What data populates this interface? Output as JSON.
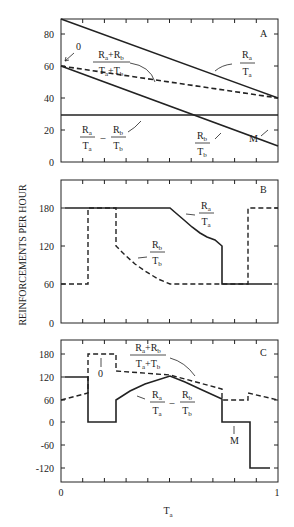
{
  "figure": {
    "ylabel": "REINFORCEMENTS PER HOUR",
    "xlabel": "T",
    "xlabel_sub": "a",
    "x_ticks": [
      "0",
      "1"
    ]
  },
  "chart_data": [
    {
      "panel": "A",
      "type": "line",
      "xlabel": "T_a",
      "ylabel": "REINFORCEMENTS PER HOUR",
      "xlim": [
        0,
        1
      ],
      "ylim": [
        0,
        90
      ],
      "y_ticks": [
        0,
        20,
        40,
        60,
        80
      ],
      "series": [
        {
          "name": "R_a/T_a",
          "style": "solid",
          "x": [
            0,
            1
          ],
          "y": [
            90,
            40
          ]
        },
        {
          "name": "(R_a+R_b)/(T_a+T_b)",
          "style": "dashed",
          "x": [
            0,
            1
          ],
          "y": [
            60,
            40
          ]
        },
        {
          "name": "R_b/T_b",
          "style": "solid",
          "x": [
            0,
            1
          ],
          "y": [
            60,
            10
          ]
        },
        {
          "name": "R_a/T_a - R_b/T_b (M)",
          "style": "solid",
          "x": [
            0,
            1
          ],
          "y": [
            30,
            30
          ]
        }
      ],
      "annotations": [
        "0",
        "M",
        "A"
      ]
    },
    {
      "panel": "B",
      "type": "line",
      "xlim": [
        0,
        1
      ],
      "ylim": [
        0,
        225
      ],
      "y_ticks": [
        0,
        60,
        120,
        180
      ],
      "series": [
        {
          "name": "R_a/T_a",
          "style": "solid",
          "x": [
            0.02,
            0.5,
            0.6,
            0.7,
            0.745,
            0.745,
            0.95
          ],
          "y": [
            180,
            180,
            158,
            135,
            120,
            60,
            60
          ]
        },
        {
          "name": "R_b/T_b",
          "style": "dashed",
          "x": [
            0,
            0.12,
            0.12,
            0.25,
            0.25,
            0.35,
            0.45,
            0.5,
            0.6,
            0.86,
            0.86,
            1
          ],
          "y": [
            60,
            60,
            180,
            180,
            120,
            90,
            70,
            60,
            60,
            60,
            180,
            180
          ]
        }
      ],
      "annotations": [
        "B"
      ]
    },
    {
      "panel": "C",
      "type": "line",
      "xlim": [
        0,
        1
      ],
      "ylim": [
        -158,
        216
      ],
      "y_ticks": [
        -120,
        -60,
        0,
        60,
        120,
        180
      ],
      "series": [
        {
          "name": "(R_a+R_b)/(T_a+T_b)",
          "style": "dashed",
          "x": [
            0,
            0.12,
            0.12,
            0.25,
            0.25,
            0.5,
            0.745,
            0.745,
            0.86,
            0.86,
            1
          ],
          "y": [
            60,
            78,
            180,
            180,
            135,
            125,
            95,
            60,
            60,
            78,
            60
          ]
        },
        {
          "name": "R_a/T_a - R_b/T_b",
          "style": "solid",
          "x": [
            0.02,
            0.12,
            0.12,
            0.25,
            0.25,
            0.38,
            0.5,
            0.62,
            0.745,
            0.745,
            0.87,
            0.87,
            0.95
          ],
          "y": [
            120,
            120,
            0,
            0,
            60,
            100,
            122,
            90,
            60,
            0,
            0,
            -120,
            -120
          ]
        }
      ],
      "annotations": [
        "0",
        "M",
        "C"
      ]
    }
  ],
  "panelA": {
    "letter": "A",
    "y_ticks": [
      "80",
      "60",
      "40",
      "20",
      "0"
    ],
    "labels": {
      "zero": "0",
      "M": "M"
    }
  },
  "panelB": {
    "letter": "B",
    "y_ticks": [
      "180",
      "120",
      "60",
      "0"
    ]
  },
  "panelC": {
    "letter": "C",
    "y_ticks": [
      "180",
      "120",
      "60",
      "0",
      "-60",
      "-120"
    ],
    "labels": {
      "zero": "0",
      "M": "M"
    }
  },
  "symbols": {
    "R": "R",
    "T": "T",
    "a": "a",
    "b": "b",
    "plus": "+",
    "minus": "–"
  }
}
